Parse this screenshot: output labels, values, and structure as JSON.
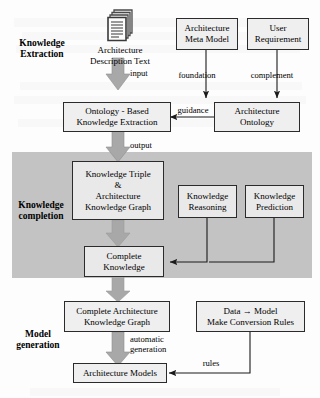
{
  "diagram": {
    "type": "flowchart",
    "phases": [
      {
        "id": "extraction",
        "label": "Knowledge\nExtraction",
        "background": "#fdfdfd"
      },
      {
        "id": "completion",
        "label": "Knowledge\ncompletion",
        "background": "#c3c3c3"
      },
      {
        "id": "generation",
        "label": "Model\ngeneration",
        "background": "#fdfdfd"
      }
    ],
    "nodes": [
      {
        "id": "arch-desc-text",
        "label": "Architecture\nDescription Text",
        "kind": "document",
        "icon": "documents-stack-icon"
      },
      {
        "id": "arch-meta-model",
        "label": "Architecture\nMeta Model",
        "kind": "box"
      },
      {
        "id": "user-requirement",
        "label": "User\nRequirement",
        "kind": "box"
      },
      {
        "id": "ontology-based-extraction",
        "label": "Ontology - Based\nKnowledge Extraction",
        "kind": "box"
      },
      {
        "id": "architecture-ontology",
        "label": "Architecture\nOntology",
        "kind": "box"
      },
      {
        "id": "knowledge-triple-graph",
        "label": "Knowledge Triple\n&\nArchitecture\nKnowledge Graph",
        "kind": "box"
      },
      {
        "id": "knowledge-reasoning",
        "label": "Knowledge\nReasoning",
        "kind": "box"
      },
      {
        "id": "knowledge-prediction",
        "label": "Knowledge\nPrediction",
        "kind": "box"
      },
      {
        "id": "complete-knowledge",
        "label": "Complete\nKnowledge",
        "kind": "box"
      },
      {
        "id": "complete-arch-kg",
        "label": "Complete Architecture\nKnowledge Graph",
        "kind": "box"
      },
      {
        "id": "conversion-rules",
        "label": "Data → Model\nMake Conversion Rules",
        "kind": "box"
      },
      {
        "id": "architecture-models",
        "label": "Architecture Models",
        "kind": "box"
      }
    ],
    "edges": [
      {
        "id": "input",
        "from": "arch-desc-text",
        "to": "ontology-based-extraction",
        "label": "input",
        "style": "block-arrow"
      },
      {
        "id": "foundation",
        "from": "arch-meta-model",
        "to": "architecture-ontology",
        "label": "foundation",
        "style": "thin-arrow"
      },
      {
        "id": "complement",
        "from": "user-requirement",
        "to": "architecture-ontology",
        "label": "complement",
        "style": "thin-arrow"
      },
      {
        "id": "guidance",
        "from": "architecture-ontology",
        "to": "ontology-based-extraction",
        "label": "guidance",
        "style": "thin-arrow"
      },
      {
        "id": "output",
        "from": "ontology-based-extraction",
        "to": "knowledge-triple-graph",
        "label": "output",
        "style": "block-arrow"
      },
      {
        "id": "triple-to-complete",
        "from": "knowledge-triple-graph",
        "to": "complete-knowledge",
        "label": "",
        "style": "block-arrow"
      },
      {
        "id": "reasoning-to-complete",
        "from": "knowledge-reasoning",
        "to": "complete-knowledge",
        "label": "",
        "style": "thin-arrow"
      },
      {
        "id": "prediction-to-complete",
        "from": "knowledge-prediction",
        "to": "complete-knowledge",
        "label": "",
        "style": "thin-arrow"
      },
      {
        "id": "complete-to-ckg",
        "from": "complete-knowledge",
        "to": "complete-arch-kg",
        "label": "",
        "style": "block-arrow"
      },
      {
        "id": "automatic-generation",
        "from": "complete-arch-kg",
        "to": "architecture-models",
        "label": "automatic\ngeneration",
        "style": "block-arrow"
      },
      {
        "id": "rules",
        "from": "conversion-rules",
        "to": "architecture-models",
        "label": "rules",
        "style": "thin-arrow"
      }
    ],
    "colors": {
      "band_gray": "#c3c3c3",
      "node_fill": "#efefef",
      "node_stroke": "#2b2b2b",
      "block_arrow": "#a8a8a8",
      "thin_arrow": "#1a1a1a",
      "page": "#fdfdfd"
    }
  }
}
